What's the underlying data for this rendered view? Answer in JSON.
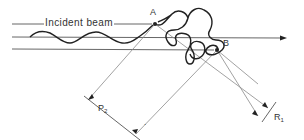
{
  "diagram": {
    "labels": {
      "incident_beam": "Incident beam",
      "point_a": "A",
      "point_b": "B",
      "distance_p": "P",
      "distance_p_sub": "2",
      "distance_r": "R",
      "distance_r_sub": "1",
      "stray_mark": "."
    },
    "colors": {
      "line": "#555555",
      "thin_line": "#8a8a8a",
      "coil": "#222222",
      "text": "#333333",
      "background": "#ffffff"
    }
  }
}
